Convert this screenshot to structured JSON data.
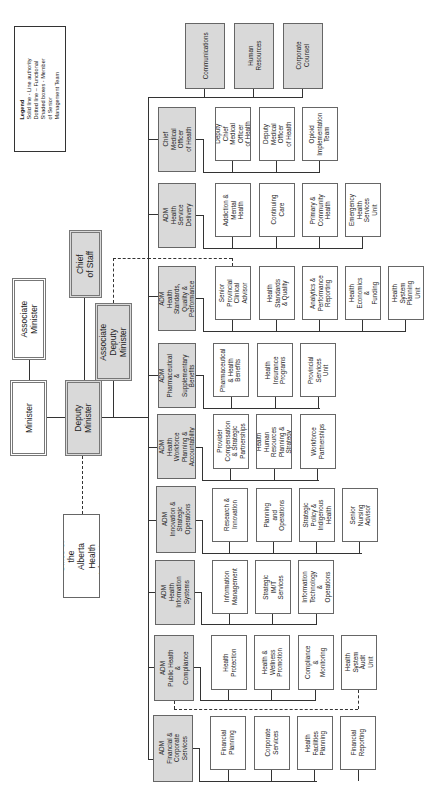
{
  "legend": {
    "title": "Legend",
    "items": [
      "Solid line - Line authority",
      "Dotted line – Functional",
      "Shaded boxes - Member of Senior\nManagement Team"
    ]
  },
  "executive": {
    "minister": "Minister",
    "associate_minister": "Associate Minister",
    "deputy_minister": "Deputy Minister",
    "associate_deputy_minister": "Associate Deputy\nMinister",
    "chief_of_staff": "Chief of Staff",
    "health_advocates": "Office of the Alberta\nHealth Advocates"
  },
  "support_units": [
    "Communications",
    "Human\nResources",
    "Corporate\nCounsel"
  ],
  "divisions": [
    {
      "head": "Chief Medical\nOfficer\nof Health",
      "units": [
        "Deputy Chief\nMedical Officer\nof Health",
        "Deputy\nMedical Officer\nof Health",
        "Opioid\nImplementation\nTeam"
      ]
    },
    {
      "head": "ADM\nHealth Service\nDelivery",
      "units": [
        "Addiction &\nMental Health",
        "Continuing\nCare",
        "Primary &\nCommunity\nHealth",
        "Emergency\nHealth\nServices Unit"
      ]
    },
    {
      "head": "ADM\nHealth Standards,\nQuality &\nPerformance",
      "units": [
        "Senior\nProvincial\nClinical\nAdvisor",
        "Health\nStandards\n& Quality",
        "Analytics &\nPerformance\nReporting",
        "Health\nEconomics &\nFunding",
        "Health\nSystem\nPlanning Unit"
      ]
    },
    {
      "head": "ADM\nPharmaceutical &\nSupplementary\nBenefits",
      "units": [
        "Pharmaceutical\n& Health\nBenefits",
        "Health\nInsurance\nPrograms",
        "Provincial\nServices Unit"
      ]
    },
    {
      "head": "ADM\nHealth Workforce\nPlanning &\nAccountability",
      "units": [
        "Provider\nCompensation\n& Strategic\nPartnerships",
        "Health Human\nResources\nPlanning &\nStrategy",
        "Workforce\nPartnerships"
      ]
    },
    {
      "head": "ADM\nInnovation &\nStrategic Operations",
      "units": [
        "Research &\nInnovation",
        "Planning and\nOperations",
        "Strategic\nPolicy &\nIndigenous\nHealth",
        "Senior\nNursing\nAdvisor"
      ]
    },
    {
      "head": "ADM\nHealth Information\nSystems",
      "units": [
        "Information\nManagement",
        "Strategic IM/T\nServices",
        "Information\nTechnology &\nOperations"
      ]
    },
    {
      "head": "ADM\nPublic Health &\nCompliance",
      "units": [
        "Health\nProtection",
        "Health &\nWellness\nPromotion",
        "Compliance\n&\nMonitoring",
        "Health\nSystem Audit\nUnit"
      ]
    },
    {
      "head": "ADM\nFinancial &\nCorporate Services",
      "units": [
        "Financial\nPlanning",
        "Corporate\nServices",
        "Health Facilities\nPlanning",
        "Financial\nReporting"
      ]
    }
  ],
  "colors": {
    "shaded": "#d9d9d9",
    "line": "#333333",
    "border": "#666666"
  }
}
